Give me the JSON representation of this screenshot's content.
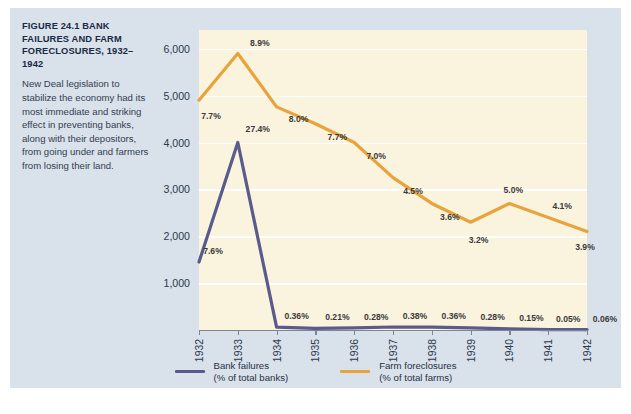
{
  "figure": {
    "title": "FIGURE 24.1  BANK FAILURES AND FARM FORECLOSURES, 1932–1942",
    "caption": "New Deal legislation to stabilize the economy had its most immediate and striking effect in preventing banks, along with their depositors, from going under and farmers from losing their land."
  },
  "colors": {
    "bank_failures": "#5b5a8c",
    "farm_foreclosures": "#e8a33d",
    "plot_background": "#faf3dd",
    "panel_background": "#d9e1eb",
    "gridline": "#ffffff",
    "axis": "#7a8596",
    "label_text": "#3a3a3a"
  },
  "legend": {
    "position": "bottom-center",
    "entries": [
      {
        "name": "bank-failures",
        "line1": "Bank failures",
        "line2": "(% of total banks)",
        "color": "#5b5a8c"
      },
      {
        "name": "farm-foreclosures",
        "line1": "Farm foreclosures",
        "line2": "(% of total farms)",
        "color": "#e8a33d"
      }
    ]
  },
  "chart_data": {
    "type": "line",
    "title": "FIGURE 24.1  BANK FAILURES AND FARM FORECLOSURES, 1932–1942",
    "xlabel": "",
    "ylabel": "",
    "x": [
      "1932",
      "1933",
      "1934",
      "1935",
      "1936",
      "1937",
      "1938",
      "1939",
      "1940",
      "1941",
      "1942"
    ],
    "xtick_labels": [
      "1932",
      "1933",
      "1934",
      "1935",
      "1936",
      "1937",
      "1938",
      "1939",
      "1940",
      "1941",
      "1942"
    ],
    "ytick_labels": [
      "1,000",
      "2,000",
      "3,000",
      "4,000",
      "5,000",
      "6,000"
    ],
    "yticks": [
      1000,
      2000,
      3000,
      4000,
      5000,
      6000
    ],
    "ylim": [
      0,
      6400
    ],
    "grid": true,
    "grid_axis": "y",
    "series": [
      {
        "name": "Bank failures (% of total banks)",
        "color": "#5b5a8c",
        "values": [
          1450,
          4000,
          60,
          35,
          47,
          64,
          60,
          47,
          25,
          8,
          10
        ],
        "point_labels": [
          "7.6%",
          "27.4%",
          "0.36%",
          "0.21%",
          "0.28%",
          "0.38%",
          "0.36%",
          "0.28%",
          "0.15%",
          "0.05%",
          "0.06%"
        ]
      },
      {
        "name": "Farm foreclosures (% of total farms)",
        "color": "#e8a33d",
        "values": [
          4900,
          5900,
          4760,
          4400,
          4000,
          3250,
          2700,
          2300,
          2700,
          2400,
          2100
        ],
        "point_labels": [
          "7.7%",
          "8.9%",
          "8.0%",
          "7.7%",
          "7.0%",
          "4.5%",
          "3.6%",
          "3.2%",
          "5.0%",
          "4.1%",
          "3.9%"
        ]
      }
    ]
  }
}
